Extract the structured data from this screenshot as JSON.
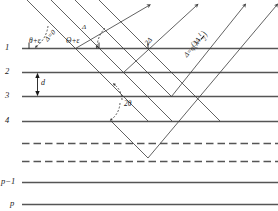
{
  "figure": {
    "kind": "bragg-diffraction-diagram"
  },
  "planes": {
    "labels": [
      "1",
      "2",
      "3",
      "4",
      "p−1",
      "p"
    ],
    "solid_line_color": "#555555",
    "dashed_line_color": "#555555",
    "dashed_count": 2
  },
  "spacing": {
    "label": "d"
  },
  "angles": {
    "incident_left": "θ+ε",
    "incident_right": "Θ+ε",
    "scattering": "2θ"
  },
  "path_differences": {
    "zero": "Δ=0",
    "one": "Δ",
    "two": "2Δ",
    "three": "3Δ",
    "general_prefix": "Δ=q",
    "general_lambda": "λ+",
    "general_frac_num": "1",
    "general_frac_den": "2"
  },
  "colors": {
    "ray": "#3a3a3a",
    "plane": "#555555",
    "text": "#1a1a1a",
    "background": "#ffffff"
  }
}
